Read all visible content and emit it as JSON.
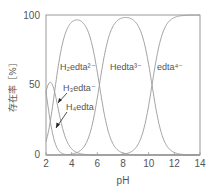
{
  "chart_data": {
    "type": "line",
    "title": "",
    "xlabel": "pH",
    "ylabel": "存在率［%］",
    "xlim": [
      2,
      14
    ],
    "ylim": [
      0,
      100
    ],
    "xticks": [
      "2",
      "4",
      "6",
      "8",
      "10",
      "12",
      "14"
    ],
    "yticks": [
      "0",
      "50",
      "100"
    ],
    "grid": false,
    "series": [
      {
        "name": "H4edta",
        "label": "H₄edta",
        "pKa_from": null,
        "peak_pH": 2.0,
        "peak_value": 50
      },
      {
        "name": "H3edta-",
        "label": "H₃edta⁻",
        "peak_pH": 2.3,
        "peak_value": 52
      },
      {
        "name": "H2edta2-",
        "label": "H₂edta²⁻",
        "peak_pH": 4.4,
        "peak_value": 96
      },
      {
        "name": "Hedta3-",
        "label": "Hedta³⁻",
        "peak_pH": 8.2,
        "peak_value": 99
      },
      {
        "name": "edta4-",
        "label": "edta⁴⁻",
        "peak_pH": 14,
        "peak_value": 100
      }
    ],
    "pKa": [
      2.0,
      2.67,
      6.16,
      10.26
    ]
  },
  "labels": {
    "h2edta": "H₂edta²⁻",
    "hedta": "Hedta³⁻",
    "edta": "edta⁴⁻",
    "h3edta": "H₃edta⁻",
    "h4edta": "H₄edta",
    "xlabel": "pH",
    "ylabel": "存在率［%］",
    "y0": "0",
    "y50": "50",
    "y100": "100",
    "x2": "2",
    "x4": "4",
    "x6": "6",
    "x8": "8",
    "x10": "10",
    "x12": "12",
    "x14": "14"
  }
}
